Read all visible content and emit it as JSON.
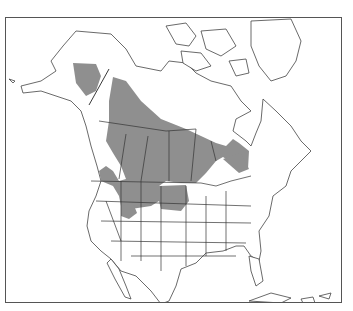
{
  "figure": {
    "type": "species-range-map",
    "region": "North America",
    "legend": [],
    "colors": {
      "range_fill": "#8f8f8f",
      "outline": "#444444",
      "background": "#ffffff",
      "frame": "#555555"
    }
  },
  "map": {
    "range_regions": [
      {
        "name": "alaska-interior",
        "description": "Shaded area in central Alaska"
      },
      {
        "name": "main-boreal-range",
        "description": "Large shaded band from Yukon/NWT southeast through the Prairie Provinces to Ontario/Quebec"
      },
      {
        "name": "northern-plains",
        "description": "Shaded area extending into Montana, North Dakota and Minnesota"
      },
      {
        "name": "rockies-outlier",
        "description": "Small shaded patches in Idaho and Wyoming"
      }
    ]
  }
}
